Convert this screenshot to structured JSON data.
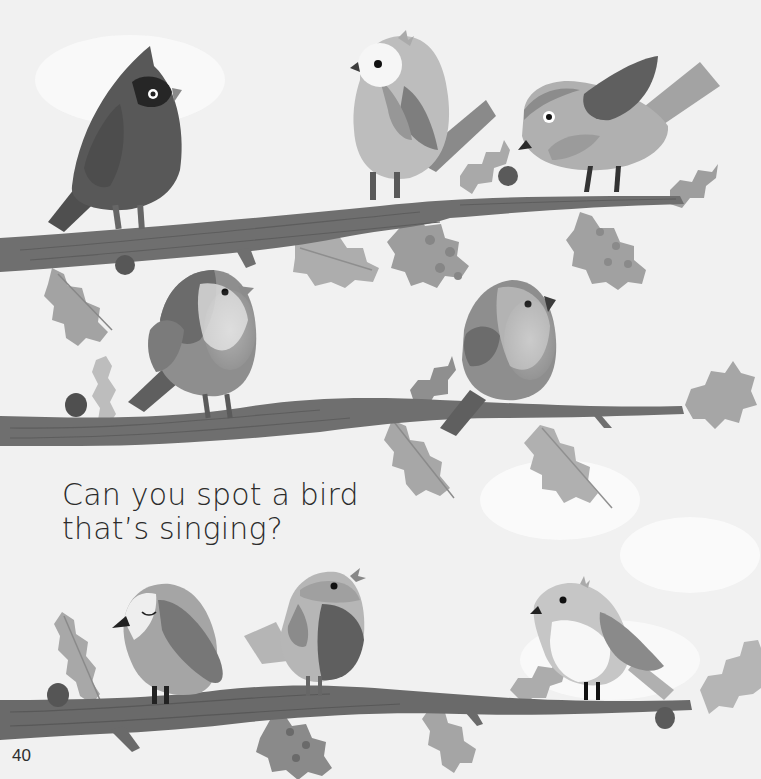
{
  "page": {
    "type": "picture-book-page",
    "mode": "grayscale",
    "background": "#f1f1f1"
  },
  "top_text_remnant": "",
  "caption": {
    "line1": "Can you spot a bird",
    "line2": "that’s singing?"
  },
  "page_number": "40",
  "colors": {
    "branch": "#6d6d6d",
    "branch_grain": "#5a5a5a",
    "holly_light": "#a9a9a9",
    "holly_mid": "#9a9a9a",
    "berry": "#555555",
    "bird_dark": "#585858",
    "bird_mid": "#8a8a8a",
    "bird_light": "#b4b4b4",
    "bird_white": "#f4f4f4",
    "eye": "#111111"
  },
  "illustration": {
    "branches": [
      {
        "name": "top-branch",
        "row": 1
      },
      {
        "name": "middle-branch",
        "row": 2
      },
      {
        "name": "bottom-branch",
        "row": 3
      }
    ],
    "birds": [
      {
        "name": "cardinal-bird",
        "row": 1,
        "position": "left",
        "pose": "perched"
      },
      {
        "name": "owl-faced-bird",
        "row": 1,
        "position": "center",
        "pose": "perched"
      },
      {
        "name": "leaning-bird",
        "row": 1,
        "position": "right",
        "pose": "bending forward"
      },
      {
        "name": "robin-bird",
        "row": 2,
        "position": "left",
        "pose": "perched"
      },
      {
        "name": "round-bird",
        "row": 2,
        "position": "center-right",
        "pose": "perched"
      },
      {
        "name": "sleeping-bird",
        "row": 3,
        "position": "left",
        "pose": "eyes closed"
      },
      {
        "name": "singing-bird",
        "row": 3,
        "position": "center",
        "pose": "beak open singing"
      },
      {
        "name": "white-belly-bird",
        "row": 3,
        "position": "right",
        "pose": "perched"
      }
    ]
  }
}
